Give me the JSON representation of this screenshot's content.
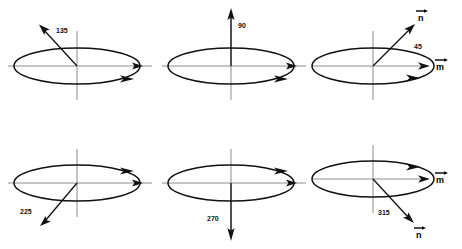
{
  "figure": {
    "title": "",
    "background_color": "#ffffff",
    "stroke_color": "#111111",
    "axis_color": "#8c8c8c",
    "rows": 2,
    "cols": 3
  },
  "panels": [
    {
      "id": "panel-135",
      "angle_label": "135",
      "normal_angle_deg": 135,
      "normal_direction": "up-left",
      "circulation": "counterclockwise-from-above",
      "circulation_arrow_position": "lower-right",
      "vertical_axis_arrow": "none",
      "horizontal_axis_arrow": "right",
      "vector_n_label": "",
      "vector_m_label": "",
      "angle_label_position": "upper-left"
    },
    {
      "id": "panel-90",
      "angle_label": "90",
      "normal_angle_deg": 90,
      "normal_direction": "up",
      "circulation": "counterclockwise-from-above",
      "circulation_arrow_position": "lower-right",
      "vertical_axis_arrow": "up",
      "horizontal_axis_arrow": "right",
      "vector_n_label": "",
      "vector_m_label": "",
      "angle_label_position": "right-of-arrow"
    },
    {
      "id": "panel-45",
      "angle_label": "45",
      "normal_angle_deg": 45,
      "normal_direction": "up-right",
      "circulation": "counterclockwise-from-above",
      "circulation_arrow_position": "lower-right",
      "vertical_axis_arrow": "none",
      "horizontal_axis_arrow": "right",
      "vector_n_label": "n",
      "vector_m_label": "m",
      "angle_label_position": "right-of-arrow"
    },
    {
      "id": "panel-225",
      "angle_label": "225",
      "normal_angle_deg": 225,
      "normal_direction": "down-left",
      "circulation": "clockwise-from-above",
      "circulation_arrow_position": "upper-right",
      "vertical_axis_arrow": "none",
      "horizontal_axis_arrow": "right",
      "vector_n_label": "",
      "vector_m_label": "",
      "angle_label_position": "left-of-arrow"
    },
    {
      "id": "panel-270",
      "angle_label": "270",
      "normal_angle_deg": 270,
      "normal_direction": "down",
      "circulation": "clockwise-from-above",
      "circulation_arrow_position": "upper-right",
      "vertical_axis_arrow": "down",
      "horizontal_axis_arrow": "right",
      "vector_n_label": "",
      "vector_m_label": "",
      "angle_label_position": "left-of-arrow"
    },
    {
      "id": "panel-315",
      "angle_label": "315",
      "normal_angle_deg": 315,
      "normal_direction": "down-right",
      "circulation": "clockwise-from-above",
      "circulation_arrow_position": "upper-right",
      "vertical_axis_arrow": "none",
      "horizontal_axis_arrow": "right",
      "vector_n_label": "n",
      "vector_m_label": "m",
      "angle_label_position": "left-of-arrow"
    }
  ],
  "vector_symbols": {
    "n": "n",
    "m": "m",
    "overbar_glyph": "arrow-overbar"
  }
}
